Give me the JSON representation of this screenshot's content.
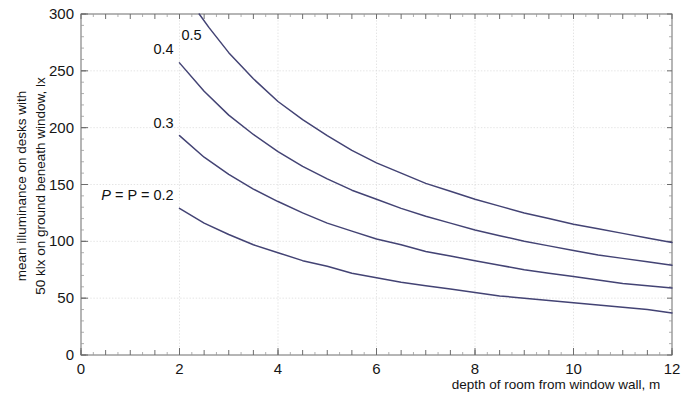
{
  "chart_data": {
    "type": "line",
    "title": "",
    "subtitle": "",
    "xlabel": "depth of room from window wall, m",
    "ylabel": "mean illuminance on desks with 50 klx on ground beneath window, lx",
    "ylabel_line1": "mean illuminance on desks with",
    "ylabel_line2": "50 klx on ground beneath window, lx",
    "xlim": [
      0,
      12
    ],
    "ylim": [
      0,
      300
    ],
    "xticks": [
      0,
      2,
      4,
      6,
      8,
      10,
      12
    ],
    "xtick_labels": [
      "0",
      "2",
      "4",
      "6",
      "8",
      "10",
      "12"
    ],
    "yticks": [
      0,
      50,
      100,
      150,
      200,
      250,
      300
    ],
    "ytick_labels": [
      "0",
      "50",
      "100",
      "150",
      "200",
      "250",
      "300"
    ],
    "xminor_step": 0.25,
    "yminor_step": 10,
    "grid": true,
    "grid_style": "dotted",
    "legend_position": "inline-curve-labels",
    "series_color": "#434374",
    "series": [
      {
        "name": "P = 0.5",
        "label": "0.5",
        "label_prefix": "",
        "label_x": 2.45,
        "label_y": 277,
        "x": [
          2.4,
          2.6,
          3.0,
          3.5,
          4.0,
          4.5,
          5.0,
          5.5,
          6.0,
          6.5,
          7.0,
          7.5,
          8.0,
          8.5,
          9.0,
          9.5,
          10.0,
          10.5,
          11.0,
          11.5,
          12.0
        ],
        "y": [
          300,
          288,
          266,
          243,
          223,
          207,
          193,
          180,
          169,
          160,
          151,
          144,
          137,
          131,
          125,
          120,
          115,
          111,
          107,
          103,
          99
        ]
      },
      {
        "name": "P = 0.4",
        "label": "0.4",
        "label_prefix": "",
        "label_x": 1.88,
        "label_y": 265,
        "x": [
          2.0,
          2.5,
          3.0,
          3.5,
          4.0,
          4.5,
          5.0,
          5.5,
          6.0,
          6.5,
          7.0,
          7.5,
          8.0,
          8.5,
          9.0,
          9.5,
          10.0,
          10.5,
          11.0,
          11.5,
          12.0
        ],
        "y": [
          257,
          232,
          211,
          194,
          179,
          166,
          155,
          145,
          137,
          129,
          122,
          116,
          110,
          105,
          100,
          96,
          92,
          88,
          85,
          82,
          79
        ]
      },
      {
        "name": "P = 0.3",
        "label": "0.3",
        "label_prefix": "",
        "label_x": 1.88,
        "label_y": 200,
        "x": [
          2.0,
          2.5,
          3.0,
          3.5,
          4.0,
          4.5,
          5.0,
          5.5,
          6.0,
          6.5,
          7.0,
          7.5,
          8.0,
          8.5,
          9.0,
          9.5,
          10.0,
          10.5,
          11.0,
          11.5,
          12.0
        ],
        "y": [
          193,
          174,
          159,
          146,
          135,
          125,
          116,
          109,
          102,
          97,
          91,
          87,
          83,
          79,
          75,
          72,
          69,
          66,
          63,
          61,
          59
        ]
      },
      {
        "name": "P = 0.2",
        "label": "P = 0.2",
        "label_prefix": "P = ",
        "label_x": 1.88,
        "label_y": 136,
        "x": [
          2.0,
          2.5,
          3.0,
          3.5,
          4.0,
          4.5,
          5.0,
          5.5,
          6.0,
          6.5,
          7.0,
          7.5,
          8.0,
          8.5,
          9.0,
          9.5,
          10.0,
          10.5,
          11.0,
          11.5,
          12.0
        ],
        "y": [
          129,
          116,
          106,
          97,
          90,
          83,
          78,
          72,
          68,
          64,
          61,
          58,
          55,
          52,
          50,
          48,
          46,
          44,
          42,
          40,
          37
        ]
      }
    ]
  },
  "axes": {
    "x_title": "depth of room from window wall, m",
    "y_title_line1": "mean illuminance on desks with",
    "y_title_line2": "50 klx on ground beneath window, lx"
  }
}
